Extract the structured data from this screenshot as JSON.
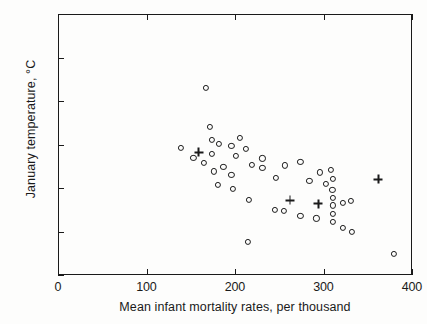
{
  "chart_data": {
    "type": "scatter",
    "title": "",
    "xlabel": "Mean infant mortality rates, per thousand",
    "ylabel": "January temperature, °C",
    "xlim": [
      0,
      400
    ],
    "ylim": [
      -20,
      10
    ],
    "xticks": [
      0,
      100,
      200,
      300,
      400
    ],
    "yticks": [
      10,
      5,
      0,
      -5,
      -10,
      -15,
      -20
    ],
    "xtick_labels": [
      "0",
      "100",
      "200",
      "300",
      "400"
    ],
    "ytick_labels": [
      "10",
      "5",
      "0",
      "-5",
      "-10",
      "-15",
      "-20"
    ],
    "grid": false,
    "legend": null,
    "marker_color": "#1a1a1a",
    "series": [
      {
        "name": "open-circle",
        "marker": "circle",
        "points": [
          [
            167,
            1.5
          ],
          [
            172,
            -3.0
          ],
          [
            174,
            -4.5
          ],
          [
            174,
            -6.1
          ],
          [
            182,
            -4.9
          ],
          [
            139,
            -5.4
          ],
          [
            153,
            -6.5
          ],
          [
            165,
            -7.1
          ],
          [
            196,
            -5.2
          ],
          [
            201,
            -6.3
          ],
          [
            206,
            -4.2
          ],
          [
            212,
            -5.5
          ],
          [
            176,
            -8.1
          ],
          [
            187,
            -7.6
          ],
          [
            196,
            -8.5
          ],
          [
            219,
            -7.3
          ],
          [
            231,
            -6.6
          ],
          [
            231,
            -7.7
          ],
          [
            181,
            -9.6
          ],
          [
            198,
            -10.1
          ],
          [
            216,
            -11.4
          ],
          [
            215,
            -16.2
          ],
          [
            256,
            -7.4
          ],
          [
            274,
            -7.0
          ],
          [
            246,
            -8.8
          ],
          [
            284,
            -9.2
          ],
          [
            296,
            -8.2
          ],
          [
            303,
            -9.5
          ],
          [
            308,
            -7.9
          ],
          [
            311,
            -9.0
          ],
          [
            310,
            -10.2
          ],
          [
            311,
            -11.1
          ],
          [
            311,
            -12.0
          ],
          [
            311,
            -13.0
          ],
          [
            311,
            -13.9
          ],
          [
            322,
            -11.7
          ],
          [
            331,
            -11.5
          ],
          [
            245,
            -12.5
          ],
          [
            255,
            -12.6
          ],
          [
            274,
            -13.2
          ],
          [
            292,
            -13.5
          ],
          [
            322,
            -14.6
          ],
          [
            332,
            -15.0
          ],
          [
            380,
            -17.6
          ]
        ]
      },
      {
        "name": "plus",
        "marker": "plus",
        "points": [
          [
            159,
            -5.9
          ],
          [
            262,
            -11.4
          ],
          [
            294,
            -11.8
          ],
          [
            362,
            -9.0
          ]
        ]
      }
    ]
  },
  "axes": {
    "x_title": "Mean infant mortality rates, per thousand",
    "y_title": "January temperature, °C"
  }
}
